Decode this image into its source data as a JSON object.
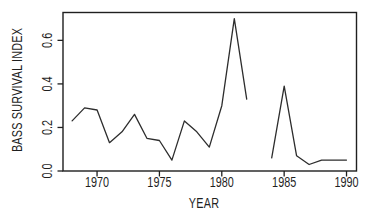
{
  "colors": {
    "background": "#ffffff",
    "ink": "#1f1f1f",
    "line": "#2d2d2d"
  },
  "chart_data": {
    "type": "line",
    "title": "",
    "xlabel": "YEAR",
    "ylabel": "BASS SURVIVAL INDEX",
    "xlim": [
      1967.27,
      1990.8
    ],
    "ylim": [
      0,
      0.728
    ],
    "grid": false,
    "legend": "none",
    "x_ticks": [
      1970,
      1975,
      1980,
      1985,
      1990
    ],
    "x_tick_labels": [
      "1970",
      "1975",
      "1980",
      "1985",
      "1990"
    ],
    "y_ticks": [
      0.0,
      0.2,
      0.4,
      0.6
    ],
    "y_tick_labels": [
      "0.0",
      "0.2",
      "0.4",
      "0.6"
    ],
    "series": [
      {
        "name": "1968-1982",
        "x": [
          1968,
          1969,
          1970,
          1971,
          1972,
          1973,
          1974,
          1975,
          1976,
          1977,
          1978,
          1979,
          1980,
          1981,
          1982
        ],
        "y": [
          0.23,
          0.29,
          0.28,
          0.13,
          0.18,
          0.26,
          0.15,
          0.14,
          0.05,
          0.23,
          0.18,
          0.11,
          0.3,
          0.7,
          0.33
        ]
      },
      {
        "name": "1984-1990",
        "x": [
          1984,
          1985,
          1986,
          1987,
          1988,
          1989,
          1990
        ],
        "y": [
          0.06,
          0.39,
          0.07,
          0.03,
          0.05,
          0.05,
          0.05
        ]
      }
    ]
  }
}
